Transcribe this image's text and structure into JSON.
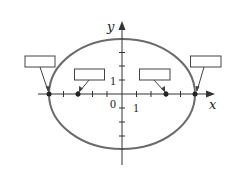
{
  "diagram": {
    "type": "ellipse-on-coordinate-axes",
    "axes": {
      "x_label": "x",
      "y_label": "y",
      "origin_label": "0",
      "x_unit_label": "1",
      "y_unit_label": "1"
    },
    "ellipse": {
      "stroke": "#6b6b6b",
      "center": [
        0,
        0
      ],
      "semi_major_units": 5,
      "semi_minor_units": 4
    },
    "points": [
      {
        "name": "left-vertex",
        "x_units": -5
      },
      {
        "name": "left-focus",
        "x_units": -3
      },
      {
        "name": "right-focus",
        "x_units": 3
      },
      {
        "name": "right-vertex",
        "x_units": 5
      }
    ],
    "label_boxes": [
      {
        "name": "left-vertex-label-box",
        "text": ""
      },
      {
        "name": "left-focus-label-box",
        "text": ""
      },
      {
        "name": "right-focus-label-box",
        "text": ""
      },
      {
        "name": "right-vertex-label-box",
        "text": ""
      }
    ],
    "colors": {
      "axis": "#333333",
      "ellipse": "#6b6b6b",
      "box_border": "#444444",
      "point": "#222222"
    }
  }
}
